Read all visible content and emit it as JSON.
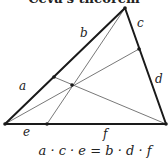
{
  "header": {
    "clipped_title": "Ceva's theorem"
  },
  "diagram": {
    "colors": {
      "stroke": "#1a1a1a",
      "cevian": "#555555",
      "text": "#222222"
    },
    "vertices": {
      "top": [
        125,
        8
      ],
      "bottom_left": [
        5,
        124
      ],
      "bottom_right": [
        166,
        124
      ]
    },
    "cevian_feet": {
      "left_side": [
        54,
        77
      ],
      "right_side": [
        139,
        49
      ],
      "base": [
        47,
        124
      ]
    },
    "concurrency_point": [
      72,
      85
    ],
    "segment_labels": [
      {
        "id": "a",
        "text": "a",
        "x": 19,
        "y": 80
      },
      {
        "id": "b",
        "text": "b",
        "x": 80,
        "y": 27
      },
      {
        "id": "c",
        "text": "c",
        "x": 137,
        "y": 17
      },
      {
        "id": "d",
        "text": "d",
        "x": 155,
        "y": 73
      },
      {
        "id": "e",
        "text": "e",
        "x": 23,
        "y": 126
      },
      {
        "id": "f",
        "text": "f",
        "x": 103,
        "y": 128
      }
    ]
  },
  "equation": "a · c · e = b · d · f"
}
